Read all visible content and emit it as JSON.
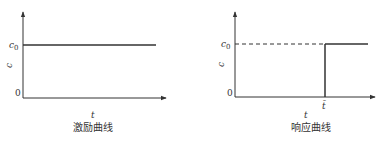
{
  "diagrams": [
    {
      "id": "excitation",
      "caption": "激励曲线",
      "x_label": "t",
      "y_label": "c",
      "y_ticks": {
        "top": "c",
        "top_sub": "0",
        "origin": "0"
      },
      "description": "constant level c0 for all t"
    },
    {
      "id": "response",
      "caption": "响应曲线",
      "x_label": "t",
      "y_label": "c",
      "y_ticks": {
        "top": "c",
        "top_sub": "0",
        "origin": "0"
      },
      "x_mark": "t̄",
      "description": "zero until t-bar, then step up to c0; dashed reference at c0 before t-bar"
    }
  ]
}
